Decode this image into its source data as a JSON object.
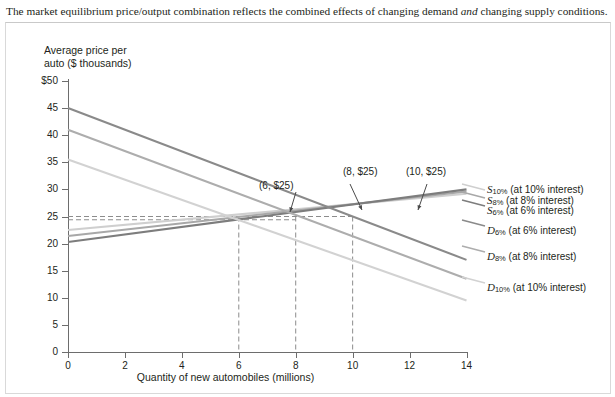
{
  "caption": {
    "before": "The market equilibrium price/output combination reflects the combined effects of changing demand ",
    "italic": "and",
    "after": " changing supply conditions."
  },
  "chart_data": {
    "type": "line",
    "title": "",
    "xlabel": "Quantity of new automobiles (millions)",
    "ylabel": "Average price per auto ($ thousands)",
    "xlim": [
      0,
      14
    ],
    "ylim": [
      0,
      50
    ],
    "xticks": [
      "0",
      "2",
      "4",
      "6",
      "8",
      "10",
      "12",
      "14"
    ],
    "yticks": [
      "$50",
      "45",
      "40",
      "35",
      "30",
      "25",
      "20",
      "15",
      "10",
      "5",
      "0"
    ],
    "grid": false,
    "legend_position": "right",
    "series": [
      {
        "name": "S10%",
        "label": "S",
        "sub": "10%",
        "note": "(at 10% interest)",
        "kind": "supply",
        "color": "#cfcfcf",
        "x": [
          0,
          14
        ],
        "y": [
          22.5,
          29.2
        ]
      },
      {
        "name": "S8%",
        "label": "S",
        "sub": "8%",
        "note": "(at 8% interest)",
        "kind": "supply",
        "color": "#a8a8a8",
        "x": [
          0,
          14
        ],
        "y": [
          21.4,
          29.6
        ]
      },
      {
        "name": "S6%",
        "label": "S",
        "sub": "6%",
        "note": "(at 6% interest)",
        "kind": "supply",
        "color": "#7d7d7d",
        "x": [
          0,
          14
        ],
        "y": [
          20.3,
          30.0
        ]
      },
      {
        "name": "D6%",
        "label": "D",
        "sub": "6%",
        "note": "(at 6% interest)",
        "kind": "demand",
        "color": "#8a8a8a",
        "x": [
          0,
          14
        ],
        "y": [
          45.0,
          17.0
        ]
      },
      {
        "name": "D8%",
        "label": "D",
        "sub": "8%",
        "note": "(at 8% interest)",
        "kind": "demand",
        "color": "#adadad",
        "x": [
          0,
          14
        ],
        "y": [
          41.0,
          13.5
        ]
      },
      {
        "name": "D10%",
        "label": "D",
        "sub": "10%",
        "note": "(at 10% interest)",
        "kind": "demand",
        "color": "#d2d2d2",
        "x": [
          0,
          14
        ],
        "y": [
          35.5,
          9.5
        ]
      }
    ],
    "equilibria": [
      {
        "label": "(6, $25)",
        "x": 6,
        "y": 25
      },
      {
        "label": "(8, $25)",
        "x": 8,
        "y": 25
      },
      {
        "label": "(10, $25)",
        "x": 10,
        "y": 25
      }
    ],
    "reference_lines": {
      "horizontal": [
        25,
        24.4
      ],
      "vertical": [
        6,
        8,
        10
      ]
    }
  },
  "legend": [
    {
      "label": "S",
      "sub": "10%",
      "note": "(at 10% interest)"
    },
    {
      "label": "S",
      "sub": "8%",
      "note": "(at 8% interest)"
    },
    {
      "label": "S",
      "sub": "6%",
      "note": "(at 6% interest)"
    },
    {
      "label": "D",
      "sub": "6%",
      "note": "(at 6% interest)"
    },
    {
      "label": "D",
      "sub": "8%",
      "note": "(at 8% interest)"
    },
    {
      "label": "D",
      "sub": "10%",
      "note": "(at 10% interest)"
    }
  ],
  "colors": {
    "axis": "#6d6d6d",
    "text": "#231f20",
    "frame": "#d9d9d9",
    "dash": "#8c8c8c"
  }
}
